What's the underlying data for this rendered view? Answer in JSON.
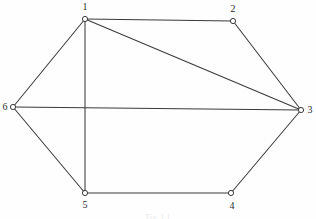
{
  "figure": {
    "caption": "Fig. 1.1",
    "background_color": "#fefefe",
    "edge_color": "#3a3a3a",
    "node_fill_color": "#ffffff",
    "node_stroke_color": "#2f2f2f",
    "label_color": "#2b2b2b"
  },
  "chart_data": {
    "type": "diagram",
    "subtype": "node-link-graph",
    "title": "Fig. 1.1",
    "directed": false,
    "node_count": 6,
    "edge_count": 9,
    "width": 316,
    "height": 219,
    "nodes": [
      {
        "id": "1",
        "label": "1",
        "x": 85,
        "y": 19,
        "label_x": 85,
        "label_y": 7,
        "label_pos": "above"
      },
      {
        "id": "2",
        "label": "2",
        "x": 233,
        "y": 21,
        "label_x": 233,
        "label_y": 9,
        "label_pos": "above"
      },
      {
        "id": "3",
        "label": "3",
        "x": 301,
        "y": 110,
        "label_x": 310,
        "label_y": 110,
        "label_pos": "right"
      },
      {
        "id": "4",
        "label": "4",
        "x": 231,
        "y": 193,
        "label_x": 232,
        "label_y": 206,
        "label_pos": "below"
      },
      {
        "id": "5",
        "label": "5",
        "x": 85,
        "y": 193,
        "label_x": 85,
        "label_y": 205,
        "label_pos": "below"
      },
      {
        "id": "6",
        "label": "6",
        "x": 13,
        "y": 107,
        "label_x": 5,
        "label_y": 107,
        "label_pos": "left"
      }
    ],
    "edges": [
      {
        "from": "1",
        "to": "2"
      },
      {
        "from": "2",
        "to": "3"
      },
      {
        "from": "1",
        "to": "3"
      },
      {
        "from": "1",
        "to": "6"
      },
      {
        "from": "1",
        "to": "5"
      },
      {
        "from": "6",
        "to": "3"
      },
      {
        "from": "6",
        "to": "5"
      },
      {
        "from": "5",
        "to": "4"
      },
      {
        "from": "4",
        "to": "3"
      }
    ],
    "node_radius": 2.6,
    "grid": false,
    "legend": null,
    "xlabel": "",
    "ylabel": ""
  }
}
